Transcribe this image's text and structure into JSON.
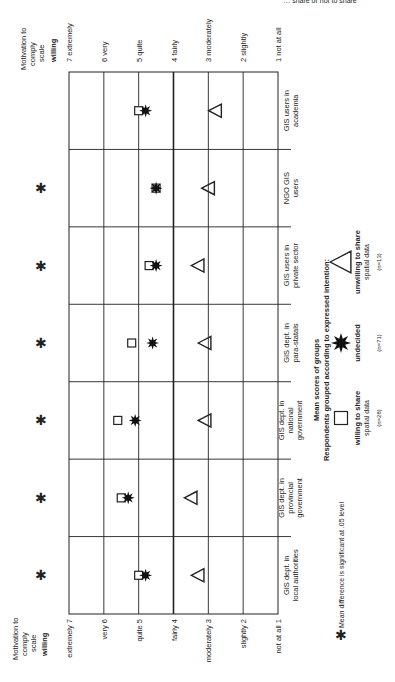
{
  "header_fragment": "… share or not to share",
  "chart_data": {
    "type": "scatter",
    "orientation": "rotated-90",
    "title": "Mean scores of groups",
    "legend_title": "Respondents grouped according to expressed intention:",
    "scale_title": "Motivation to comply scale",
    "scale_subtitle": "willing",
    "scale": [
      {
        "value": 7,
        "label": "7 extremely",
        "bottom_label": "extremely 7"
      },
      {
        "value": 6,
        "label": "6 very",
        "bottom_label": "very 6"
      },
      {
        "value": 5,
        "label": "5 quite",
        "bottom_label": "quite 5"
      },
      {
        "value": 4,
        "label": "4 fairly",
        "bottom_label": "fairly 4"
      },
      {
        "value": 3,
        "label": "3 moderately",
        "bottom_label": "moderately 3"
      },
      {
        "value": 2,
        "label": "2 slightly",
        "bottom_label": "slightly 2"
      },
      {
        "value": 1,
        "label": "1 not at all",
        "bottom_label": "not at all 1"
      }
    ],
    "categories": [
      [
        "GIS dept. in",
        "local authorities"
      ],
      [
        "GIS dept. in",
        "provincial",
        "government"
      ],
      [
        "GIS dept. in",
        "national",
        "government"
      ],
      [
        "GIS dept. in",
        "para-statals"
      ],
      [
        "GIS users in",
        "private sector"
      ],
      [
        "NGO GIS",
        "users"
      ],
      [
        "GIS users in",
        "academia"
      ]
    ],
    "series": [
      {
        "name": "willing to share spatial data",
        "n": "(n=28)",
        "marker": "square",
        "values": [
          5.0,
          5.5,
          5.6,
          5.2,
          4.7,
          4.5,
          5.0
        ]
      },
      {
        "name": "undecided",
        "n": "(n=71)",
        "marker": "star",
        "values": [
          4.8,
          5.3,
          5.1,
          4.6,
          4.5,
          4.5,
          4.8
        ]
      },
      {
        "name": "unwilling to share spatial data",
        "n": "(n=13)",
        "marker": "triangle",
        "values": [
          3.3,
          3.5,
          3.1,
          3.1,
          3.3,
          3.0,
          2.8
        ]
      }
    ],
    "significant": [
      true,
      true,
      true,
      true,
      true,
      true,
      false
    ],
    "footnote": "Mean difference is significant at .05 level",
    "ylim": [
      1,
      7
    ]
  },
  "legend": {
    "title_line1": "Mean scores of groups",
    "title_line2": "Respondents grouped according to expressed intention:",
    "items": [
      {
        "label1": "willing to share",
        "label2": "spatial data",
        "n": "(n=28)"
      },
      {
        "label1": "undecided",
        "label2": "",
        "n": "(n=71)"
      },
      {
        "label1": "unwilling to share",
        "label2": "spatial data",
        "n": "(n=13)"
      }
    ]
  },
  "axis": {
    "title_lines": [
      "Motivation to",
      "comply",
      "scale"
    ],
    "bold": "willing"
  }
}
